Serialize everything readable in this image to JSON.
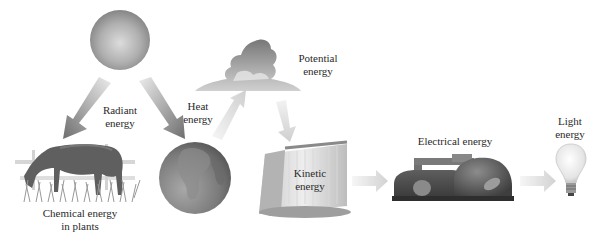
{
  "diagram": {
    "type": "energy-conversion-flow",
    "nodes": [
      {
        "id": "sun",
        "icon": "sun-icon",
        "label": ""
      },
      {
        "id": "horse-plants",
        "icon": "horse-grazing-icon",
        "label_lines": [
          "Chemical energy",
          "in plants"
        ]
      },
      {
        "id": "earth",
        "icon": "earth-globe-icon",
        "label": ""
      },
      {
        "id": "cloud",
        "icon": "cloud-icon",
        "label_lines": [
          "Potential",
          "energy"
        ]
      },
      {
        "id": "waterfall",
        "icon": "waterfall-icon",
        "label_lines": [
          "Kinetic",
          "energy"
        ]
      },
      {
        "id": "power-plant",
        "icon": "generator-icon",
        "label_lines": [
          "Electrical energy"
        ]
      },
      {
        "id": "light-bulb",
        "icon": "light-bulb-icon",
        "label_lines": [
          "Light",
          "energy"
        ]
      }
    ],
    "edges": [
      {
        "from": "sun",
        "to": "horse-plants",
        "label": "Radiant energy"
      },
      {
        "from": "sun",
        "to": "earth",
        "label": "Radiant energy"
      },
      {
        "from": "earth",
        "to": "cloud",
        "label_lines": [
          "Heat",
          "energy"
        ]
      },
      {
        "from": "cloud",
        "to": "waterfall",
        "label": ""
      },
      {
        "from": "waterfall",
        "to": "power-plant",
        "label": ""
      },
      {
        "from": "power-plant",
        "to": "light-bulb",
        "label": ""
      }
    ],
    "labels": {
      "radiant": [
        "Radiant",
        "energy"
      ],
      "heat": [
        "Heat",
        "energy"
      ],
      "potential": [
        "Potential",
        "energy"
      ],
      "kinetic": [
        "Kinetic",
        "energy"
      ],
      "electrical": "Electrical energy",
      "light": [
        "Light",
        "energy"
      ],
      "chemical": [
        "Chemical energy",
        "in plants"
      ]
    },
    "colors": {
      "background": "#ffffff",
      "sun_light": "#d8d8d8",
      "sun_dark": "#8a8a8a",
      "arrow_dark": "#7a7a7a",
      "arrow_light": "#e8e8e8",
      "earth": "#7f7f7f",
      "text": "#2a2a2a"
    }
  }
}
